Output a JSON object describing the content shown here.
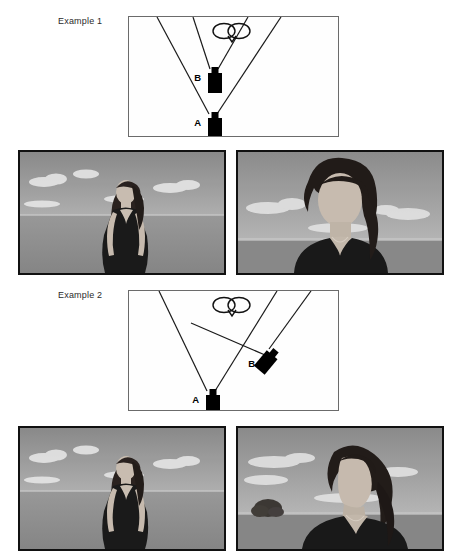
{
  "figure": {
    "colors": {
      "camera_body": "#000000",
      "diagram_border": "#6b6b6b",
      "sight_line": "#1a1a1a",
      "photo_border": "#111111",
      "label_text": "#2b2b2b"
    }
  },
  "examples": [
    {
      "label": "Example 1",
      "schematic": {
        "subject_icon": "overhead-head-icon",
        "cameras": [
          {
            "id": "A",
            "label": "A",
            "position": "center-bottom",
            "rotation_deg": 0
          },
          {
            "id": "B",
            "label": "B",
            "position": "center-middle",
            "rotation_deg": 0
          }
        ],
        "sight_lines": 4
      },
      "photos": [
        {
          "position": "left",
          "caption": "",
          "scene": "woman in dark sleeveless dress standing in open grass field with clouds, wide framing"
        },
        {
          "position": "right",
          "caption": "",
          "scene": "same woman framed closer, head and shoulders, hair blowing, horizon behind"
        }
      ]
    },
    {
      "label": "Example 2",
      "schematic": {
        "subject_icon": "overhead-head-icon",
        "cameras": [
          {
            "id": "A",
            "label": "A",
            "position": "center-bottom",
            "rotation_deg": 0
          },
          {
            "id": "B",
            "label": "B",
            "position": "right-middle",
            "rotation_deg": 40
          }
        ],
        "sight_lines": 4
      },
      "photos": [
        {
          "position": "left",
          "caption": "",
          "scene": "woman in dark sleeveless dress standing in open grass field with clouds, wide framing"
        },
        {
          "position": "right",
          "caption": "",
          "scene": "same woman in three-quarter profile looking right, small bush on horizon at left"
        }
      ]
    }
  ]
}
